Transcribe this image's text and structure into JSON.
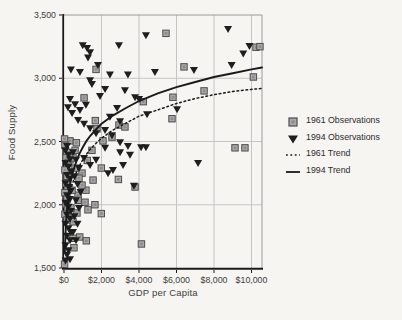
{
  "figure": {
    "x_axis_title": "GDP per Capita",
    "y_axis_title": "Food Supply"
  },
  "legend": {
    "items": [
      {
        "label": "1961 Observations",
        "marker": "square"
      },
      {
        "label": "1994 Observations",
        "marker": "triangle-down"
      },
      {
        "label": "1961 Trend",
        "marker": "dotted-line"
      },
      {
        "label": "1994 Trend",
        "marker": "solid-line"
      }
    ]
  },
  "colors": {
    "square_fill": "#a9a9a9",
    "square_edge": "#4d4d4d",
    "triangle_fill": "#1e1e1e",
    "trend_line": "#1a1a1a",
    "grid": "#c0c0c0",
    "axis": "#1a1a1a",
    "box": "#9a9a9a",
    "text": "#3d3d3d",
    "background": "#f6f5f2"
  },
  "chart_data": {
    "type": "scatter",
    "title": "",
    "xlabel": "GDP per Capita",
    "ylabel": "Food Supply",
    "xlim": [
      0,
      10560
    ],
    "ylim": [
      1500,
      3500
    ],
    "grid": true,
    "legend_position": "right",
    "x_ticks": [
      {
        "value": 0,
        "label": "$0"
      },
      {
        "value": 2000,
        "label": "$2,000"
      },
      {
        "value": 4000,
        "label": "$4,000"
      },
      {
        "value": 6000,
        "label": "$6,000"
      },
      {
        "value": 8000,
        "label": "$8,000"
      },
      {
        "value": 10000,
        "label": "$10,000"
      }
    ],
    "y_ticks": [
      {
        "value": 1500,
        "label": "1,500"
      },
      {
        "value": 2000,
        "label": "2,000"
      },
      {
        "value": 2500,
        "label": "2,500"
      },
      {
        "value": 3000,
        "label": "3,000"
      },
      {
        "value": 3500,
        "label": "3,500"
      }
    ],
    "series": [
      {
        "name": "1961 Observations",
        "type": "scatter",
        "marker": "square",
        "points": [
          [
            5440,
            3355
          ],
          [
            10240,
            3245
          ],
          [
            10450,
            3250
          ],
          [
            1710,
            3070
          ],
          [
            6400,
            3090
          ],
          [
            10100,
            3010
          ],
          [
            7470,
            2900
          ],
          [
            5810,
            2850
          ],
          [
            4230,
            2815
          ],
          [
            1070,
            2845
          ],
          [
            5760,
            2680
          ],
          [
            2930,
            2630
          ],
          [
            3250,
            2615
          ],
          [
            1670,
            2665
          ],
          [
            1760,
            2600
          ],
          [
            2080,
            2505
          ],
          [
            2560,
            2535
          ],
          [
            1490,
            2430
          ],
          [
            9120,
            2450
          ],
          [
            9650,
            2450
          ],
          [
            320,
            2505
          ],
          [
            30,
            2520
          ],
          [
            660,
            2490
          ],
          [
            1240,
            2350
          ],
          [
            1990,
            2290
          ],
          [
            1550,
            2195
          ],
          [
            1170,
            2115
          ],
          [
            750,
            2075
          ],
          [
            3790,
            2140
          ],
          [
            2900,
            2200
          ],
          [
            320,
            2355
          ],
          [
            590,
            2290
          ],
          [
            960,
            2250
          ],
          [
            1280,
            1960
          ],
          [
            1990,
            1930
          ],
          [
            690,
            1935
          ],
          [
            210,
            1895
          ],
          [
            480,
            1865
          ],
          [
            480,
            1735
          ],
          [
            840,
            1745
          ],
          [
            1190,
            1715
          ],
          [
            530,
            1660
          ],
          [
            4130,
            1690
          ],
          [
            30,
            1530
          ],
          [
            50,
            2470
          ],
          [
            160,
            2415
          ],
          [
            110,
            2370
          ],
          [
            210,
            2330
          ],
          [
            50,
            2275
          ],
          [
            160,
            2225
          ],
          [
            110,
            2170
          ],
          [
            210,
            2130
          ],
          [
            50,
            2095
          ],
          [
            160,
            2045
          ],
          [
            110,
            2005
          ],
          [
            210,
            1975
          ],
          [
            50,
            1925
          ],
          [
            160,
            1880
          ],
          [
            430,
            2115
          ],
          [
            750,
            2035
          ],
          [
            370,
            1975
          ],
          [
            480,
            2370
          ],
          [
            590,
            2430
          ],
          [
            800,
            2210
          ],
          [
            960,
            2155
          ],
          [
            1120,
            2020
          ],
          [
            1650,
            2000
          ]
        ]
      },
      {
        "name": "1994 Observations",
        "type": "scatter",
        "marker": "triangle-down",
        "points": [
          [
            8750,
            3390
          ],
          [
            4370,
            3340
          ],
          [
            1000,
            3260
          ],
          [
            1230,
            3240
          ],
          [
            2930,
            3260
          ],
          [
            1280,
            3165
          ],
          [
            1390,
            3205
          ],
          [
            9890,
            3255
          ],
          [
            9560,
            3195
          ],
          [
            370,
            3070
          ],
          [
            850,
            3050
          ],
          [
            1810,
            3105
          ],
          [
            2450,
            3030
          ],
          [
            3410,
            3030
          ],
          [
            4850,
            3050
          ],
          [
            8940,
            3105
          ],
          [
            6930,
            3065
          ],
          [
            1390,
            2985
          ],
          [
            1490,
            2955
          ],
          [
            2190,
            2915
          ],
          [
            1920,
            2860
          ],
          [
            3250,
            2905
          ],
          [
            3790,
            2850
          ],
          [
            4000,
            2835
          ],
          [
            6030,
            2755
          ],
          [
            4430,
            2715
          ],
          [
            2830,
            2765
          ],
          [
            2450,
            2695
          ],
          [
            2990,
            2660
          ],
          [
            1170,
            2790
          ],
          [
            850,
            2750
          ],
          [
            590,
            2795
          ],
          [
            320,
            2835
          ],
          [
            210,
            2770
          ],
          [
            430,
            2725
          ],
          [
            750,
            2670
          ],
          [
            1070,
            2640
          ],
          [
            1390,
            2605
          ],
          [
            1710,
            2565
          ],
          [
            2190,
            2590
          ],
          [
            2560,
            2550
          ],
          [
            2990,
            2495
          ],
          [
            3410,
            2465
          ],
          [
            4110,
            2455
          ],
          [
            4370,
            2455
          ],
          [
            2190,
            2450
          ],
          [
            2990,
            2415
          ],
          [
            3520,
            2395
          ],
          [
            2350,
            2250
          ],
          [
            2610,
            2275
          ],
          [
            3150,
            2315
          ],
          [
            3730,
            2150
          ],
          [
            7150,
            2330
          ],
          [
            1710,
            2355
          ],
          [
            1390,
            2315
          ],
          [
            1070,
            2370
          ],
          [
            160,
            2465
          ],
          [
            80,
            2430
          ],
          [
            240,
            2395
          ],
          [
            320,
            2360
          ],
          [
            80,
            2330
          ],
          [
            240,
            2300
          ],
          [
            370,
            2265
          ],
          [
            160,
            2235
          ],
          [
            320,
            2205
          ],
          [
            80,
            2170
          ],
          [
            240,
            2140
          ],
          [
            370,
            2110
          ],
          [
            160,
            2075
          ],
          [
            320,
            2045
          ],
          [
            80,
            2015
          ],
          [
            240,
            1985
          ],
          [
            370,
            1950
          ],
          [
            160,
            1920
          ],
          [
            320,
            1890
          ],
          [
            80,
            1850
          ],
          [
            240,
            1815
          ],
          [
            370,
            1785
          ],
          [
            160,
            1755
          ],
          [
            320,
            1720
          ],
          [
            80,
            1680
          ],
          [
            240,
            1640
          ],
          [
            160,
            1605
          ],
          [
            320,
            1570
          ],
          [
            480,
            2415
          ],
          [
            640,
            2355
          ],
          [
            800,
            2290
          ],
          [
            560,
            2225
          ],
          [
            720,
            2165
          ],
          [
            880,
            2100
          ],
          [
            640,
            2035
          ],
          [
            800,
            1975
          ],
          [
            560,
            1910
          ],
          [
            720,
            1850
          ],
          [
            480,
            1785
          ],
          [
            640,
            1720
          ],
          [
            80,
            1560
          ]
        ]
      },
      {
        "name": "1961 Trend",
        "type": "line",
        "style": "dotted",
        "points": [
          [
            150,
            1900
          ],
          [
            200,
            1970
          ],
          [
            250,
            2025
          ],
          [
            300,
            2070
          ],
          [
            400,
            2140
          ],
          [
            500,
            2190
          ],
          [
            600,
            2235
          ],
          [
            700,
            2270
          ],
          [
            850,
            2315
          ],
          [
            1000,
            2355
          ],
          [
            1200,
            2400
          ],
          [
            1400,
            2440
          ],
          [
            1700,
            2485
          ],
          [
            2000,
            2525
          ],
          [
            2600,
            2590
          ],
          [
            3300,
            2645
          ],
          [
            4000,
            2700
          ],
          [
            5000,
            2750
          ],
          [
            6000,
            2800
          ],
          [
            7000,
            2840
          ],
          [
            8000,
            2870
          ],
          [
            9000,
            2895
          ],
          [
            10000,
            2912
          ],
          [
            10560,
            2920
          ]
        ]
      },
      {
        "name": "1994 Trend",
        "type": "line",
        "style": "solid",
        "points": [
          [
            40,
            1620
          ],
          [
            60,
            1700
          ],
          [
            80,
            1760
          ],
          [
            100,
            1845
          ],
          [
            150,
            1950
          ],
          [
            200,
            2030
          ],
          [
            250,
            2090
          ],
          [
            300,
            2140
          ],
          [
            400,
            2215
          ],
          [
            500,
            2270
          ],
          [
            600,
            2320
          ],
          [
            700,
            2360
          ],
          [
            850,
            2410
          ],
          [
            1000,
            2455
          ],
          [
            1200,
            2505
          ],
          [
            1400,
            2545
          ],
          [
            1700,
            2595
          ],
          [
            2000,
            2640
          ],
          [
            2600,
            2705
          ],
          [
            3300,
            2765
          ],
          [
            4000,
            2820
          ],
          [
            5000,
            2880
          ],
          [
            6000,
            2930
          ],
          [
            7000,
            2970
          ],
          [
            8000,
            3010
          ],
          [
            9000,
            3040
          ],
          [
            10000,
            3070
          ],
          [
            10560,
            3085
          ]
        ]
      }
    ]
  }
}
